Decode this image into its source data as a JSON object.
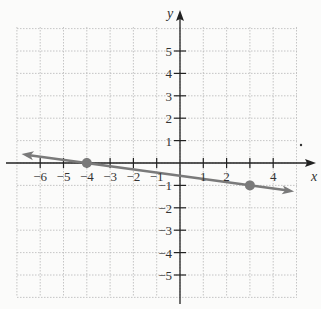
{
  "chart_data": {
    "type": "line",
    "title": "",
    "xlabel": "x",
    "ylabel": "y",
    "xlim": [
      -7,
      5
    ],
    "ylim": [
      -6,
      6
    ],
    "grid": true,
    "x_ticks": [
      -6,
      -5,
      -4,
      -3,
      -2,
      -1,
      1,
      2,
      4
    ],
    "x_tick_labels": [
      "−6",
      "−5",
      "−4",
      "−3",
      "−2",
      "−1",
      "1",
      "2",
      "4"
    ],
    "y_ticks": [
      5,
      4,
      3,
      2,
      1,
      -1,
      -2,
      -3,
      -4,
      -5
    ],
    "y_tick_labels": [
      "5",
      "4",
      "3",
      "2",
      "1",
      "−1",
      "−2",
      "−3",
      "−4",
      "−5"
    ],
    "series": [
      {
        "name": "line",
        "equation": "y = -x/7 - 4/7",
        "points": [
          {
            "x": -4,
            "y": 0
          },
          {
            "x": 3,
            "y": -1
          }
        ],
        "arrows_both_ends": true,
        "color": "#7a7a7a"
      }
    ]
  },
  "colors": {
    "axis": "#222222",
    "grid": "#b8b8b8",
    "line": "#7a7a7a",
    "point": "#7a7a7a",
    "background": "#fbfbfa"
  }
}
